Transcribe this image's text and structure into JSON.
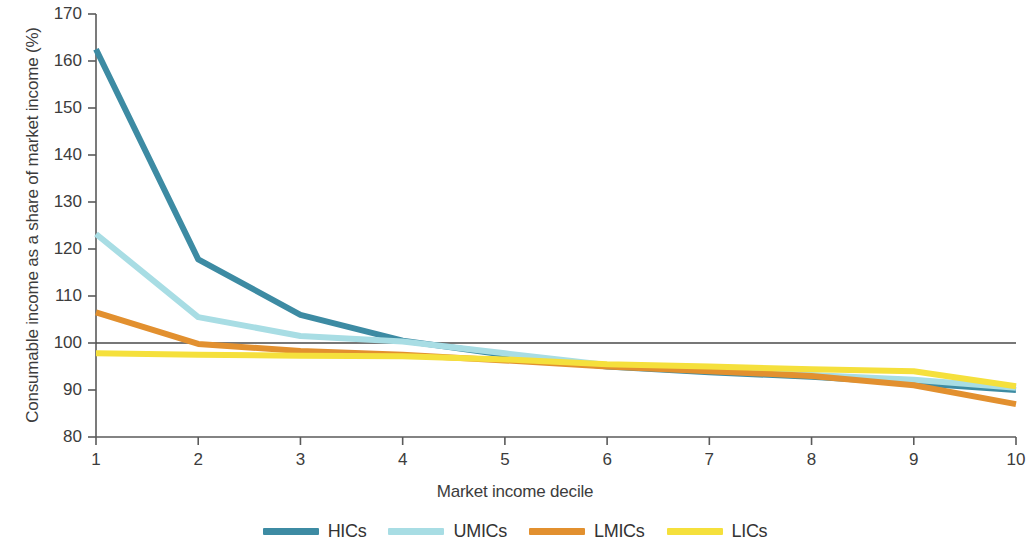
{
  "chart_data": {
    "type": "line",
    "title": "",
    "xlabel": "Market income decile",
    "ylabel": "Consumable income as a share of market income (%)",
    "x": [
      1,
      2,
      3,
      4,
      5,
      6,
      7,
      8,
      9,
      10
    ],
    "xtick_labels": [
      "1",
      "2",
      "3",
      "4",
      "5",
      "6",
      "7",
      "8",
      "9",
      "10"
    ],
    "ytick_labels": [
      "80",
      "90",
      "100",
      "110",
      "120",
      "130",
      "140",
      "150",
      "160",
      "170"
    ],
    "yticks": [
      80,
      90,
      100,
      110,
      120,
      130,
      140,
      150,
      160,
      170
    ],
    "ylim": [
      80,
      170
    ],
    "xlim": [
      1,
      10
    ],
    "grid": false,
    "legend_position": "bottom",
    "reference_line": {
      "value": 100,
      "color": "#4a4a4a",
      "label": ""
    },
    "series": [
      {
        "name": "HICs",
        "color": "#3d8ba3",
        "values": [
          162.5,
          117.8,
          106.0,
          100.5,
          97.5,
          95.0,
          93.8,
          92.8,
          91.5,
          90.0
        ]
      },
      {
        "name": "UMICs",
        "color": "#a8dde4",
        "values": [
          123.2,
          105.5,
          101.5,
          100.3,
          97.8,
          95.3,
          94.2,
          93.2,
          92.2,
          90.5
        ]
      },
      {
        "name": "LMICs",
        "color": "#e2902f",
        "values": [
          106.5,
          99.8,
          98.3,
          97.5,
          96.3,
          95.0,
          94.0,
          93.0,
          91.0,
          87.0
        ]
      },
      {
        "name": "LICs",
        "color": "#f5e03c",
        "values": [
          97.8,
          97.5,
          97.3,
          97.2,
          96.5,
          95.5,
          95.0,
          94.4,
          94.0,
          90.8
        ]
      }
    ],
    "legend": [
      {
        "label": "HICs",
        "color": "#3d8ba3"
      },
      {
        "label": "UMICs",
        "color": "#a8dde4"
      },
      {
        "label": "LMICs",
        "color": "#e2902f"
      },
      {
        "label": "LICs",
        "color": "#f5e03c"
      }
    ],
    "axis_color": "#5a5a5a"
  }
}
